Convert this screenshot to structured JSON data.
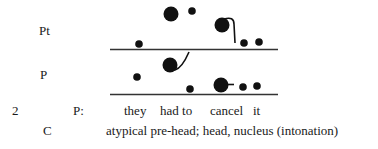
{
  "rows": {
    "pt_label": "Pt",
    "p_label": "P"
  },
  "example": {
    "number": "2",
    "speaker_label": "P:",
    "words": [
      "they",
      "had to",
      "cancel",
      "it"
    ],
    "code_label": "C",
    "code_description": "atypical pre-head; head, nucleus (intonation)"
  },
  "colors": {
    "ink": "#111111",
    "rule": "#333333",
    "text": "#1a1a1a"
  }
}
